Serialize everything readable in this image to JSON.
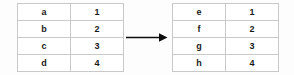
{
  "diagram": {
    "type": "table-mapping",
    "background_color": "#fdfdfd",
    "border_color": "#c9c9c9",
    "text_color": "#1a1a1a",
    "arrow_color": "#000000",
    "source_table": {
      "name": "source-table",
      "columns": 2,
      "rows": [
        {
          "key": "a",
          "value": "1"
        },
        {
          "key": "b",
          "value": "2"
        },
        {
          "key": "c",
          "value": "3"
        },
        {
          "key": "d",
          "value": "4"
        }
      ]
    },
    "target_table": {
      "name": "target-table",
      "columns": 2,
      "rows": [
        {
          "key": "e",
          "value": "1"
        },
        {
          "key": "f",
          "value": "2"
        },
        {
          "key": "g",
          "value": "3"
        },
        {
          "key": "h",
          "value": "4"
        }
      ]
    },
    "connector": {
      "icon": "right-arrow-icon",
      "direction": "right",
      "label": ""
    }
  }
}
